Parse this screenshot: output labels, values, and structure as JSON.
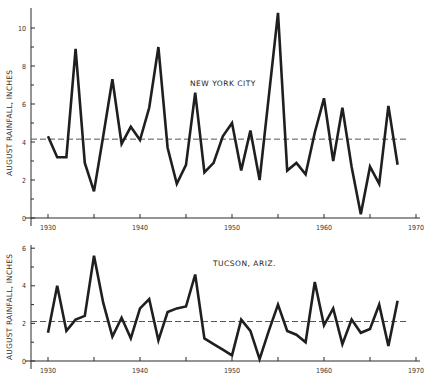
{
  "chart_data": [
    {
      "type": "line",
      "title": "NEW YORK CITY",
      "xlabel": "",
      "ylabel": "AUGUST RAINFALL, INCHES",
      "xlim": [
        1928,
        1970
      ],
      "ylim": [
        0,
        11
      ],
      "xticks": [
        1930,
        1935,
        1940,
        1945,
        1950,
        1955,
        1960,
        1965,
        1970
      ],
      "xtick_labels": [
        "1930",
        "",
        "1940",
        "",
        "1950",
        "",
        "1960",
        "",
        "1970"
      ],
      "yticks": [
        0,
        2,
        4,
        6,
        8,
        10
      ],
      "yminor": [
        1,
        3,
        5,
        7,
        9
      ],
      "mean_line": 4.15,
      "x": [
        1930,
        1931,
        1932,
        1933,
        1934,
        1935,
        1936,
        1937,
        1938,
        1939,
        1940,
        1941,
        1942,
        1943,
        1944,
        1945,
        1946,
        1947,
        1948,
        1949,
        1950,
        1951,
        1952,
        1953,
        1954,
        1955,
        1956,
        1957,
        1958,
        1959,
        1960,
        1961,
        1962,
        1963,
        1964,
        1965,
        1966,
        1967,
        1968
      ],
      "values": [
        4.3,
        3.2,
        3.2,
        8.9,
        2.9,
        1.4,
        4.3,
        7.3,
        3.9,
        4.8,
        4.1,
        5.8,
        9.0,
        3.7,
        1.8,
        2.8,
        6.6,
        2.4,
        2.9,
        4.3,
        5.0,
        2.5,
        4.6,
        2.0,
        6.4,
        10.8,
        2.5,
        2.9,
        2.3,
        4.5,
        6.3,
        3.0,
        5.8,
        2.7,
        0.2,
        2.7,
        1.8,
        5.9,
        2.8
      ]
    },
    {
      "type": "line",
      "title": "TUCSON, ARIZ.",
      "xlabel": "",
      "ylabel": "AUGUST RAINFALL, INCHES",
      "xlim": [
        1928,
        1970
      ],
      "ylim": [
        0,
        6
      ],
      "xticks": [
        1930,
        1935,
        1940,
        1945,
        1950,
        1955,
        1960,
        1965,
        1970
      ],
      "xtick_labels": [
        "1930",
        "",
        "1940",
        "",
        "1950",
        "",
        "1960",
        "",
        "1970"
      ],
      "yticks": [
        0,
        2,
        4,
        6
      ],
      "yminor": [
        1,
        3,
        5
      ],
      "mean_line": 2.1,
      "x": [
        1930,
        1931,
        1932,
        1933,
        1934,
        1935,
        1936,
        1937,
        1938,
        1939,
        1940,
        1941,
        1942,
        1943,
        1944,
        1945,
        1946,
        1947,
        1948,
        1949,
        1950,
        1951,
        1952,
        1953,
        1954,
        1955,
        1956,
        1957,
        1958,
        1959,
        1960,
        1961,
        1962,
        1963,
        1964,
        1965,
        1966,
        1967,
        1968
      ],
      "values": [
        1.5,
        4.0,
        1.6,
        2.2,
        2.4,
        5.6,
        3.1,
        1.3,
        2.3,
        1.2,
        2.8,
        3.3,
        1.1,
        2.6,
        2.8,
        2.9,
        4.6,
        1.2,
        0.9,
        0.6,
        0.3,
        2.2,
        1.6,
        0.1,
        1.6,
        3.0,
        1.6,
        1.4,
        1.0,
        4.2,
        1.9,
        2.8,
        0.9,
        2.2,
        1.5,
        1.7,
        3.0,
        0.8,
        3.2
      ]
    }
  ],
  "layout": {
    "panels": [
      {
        "x0": 31,
        "year0": 1930,
        "px_per_year": 9.2,
        "y_zero": 218,
        "px_per_unit": 19.0,
        "y_top": 8,
        "x_end": 420,
        "mean_x0": 31,
        "mean_x1": 408,
        "label_x": 190,
        "label_y": 86
      },
      {
        "x0": 31,
        "year0": 1930,
        "px_per_year": 9.2,
        "y_zero": 361,
        "px_per_unit": 18.8,
        "y_top": 245,
        "x_end": 420,
        "mean_x0": 31,
        "mean_x1": 406,
        "label_x": 213,
        "label_y": 266
      }
    ]
  }
}
